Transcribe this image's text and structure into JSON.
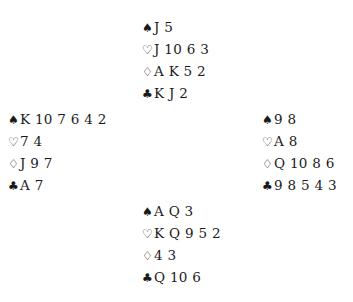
{
  "suits": {
    "spades": "♠",
    "hearts": "♡",
    "diamonds": "♢",
    "clubs": "♣"
  },
  "hands": {
    "north": {
      "spades": "J 5",
      "hearts": "J 10 6 3",
      "diamonds": "A K 5 2",
      "clubs": "K J 2"
    },
    "west": {
      "spades": "K 10 7 6 4 2",
      "hearts": "7 4",
      "diamonds": "J 9 7",
      "clubs": "A 7"
    },
    "east": {
      "spades": "9 8",
      "hearts": "A 8",
      "diamonds": "Q 10 8 6",
      "clubs": "9 8 5 4 3"
    },
    "south": {
      "spades": "A Q 3",
      "hearts": "K Q 9 5 2",
      "diamonds": "4 3",
      "clubs": "Q 10 6"
    }
  }
}
